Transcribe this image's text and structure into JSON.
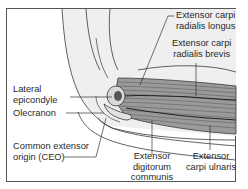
{
  "figure": {
    "colors": {
      "frame": "#555555",
      "line": "#3a3a3a",
      "skin": "#ececec",
      "muscle": "#8a8a8a",
      "muscle_dark": "#4a4a4a",
      "text": "#2a2a2a"
    },
    "labels": {
      "ecrl_1": "Extensor carpi",
      "ecrl_2": "radialis longus",
      "ecrb_1": "Extensor carpi",
      "ecrb_2": "radialis brevis",
      "lat_epi_1": "Lateral",
      "lat_epi_2": "epicondyle",
      "olecranon": "Olecranon",
      "ceo_1": "Common extensor",
      "ceo_2": "origin (CEO)",
      "edc_1": "Extensor",
      "edc_2": "digitorum",
      "edc_3": "communis",
      "ecu_1": "Extensor",
      "ecu_2": "carpi ulnaris"
    }
  }
}
